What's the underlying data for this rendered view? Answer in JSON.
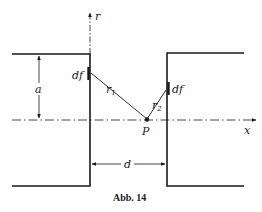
{
  "figure": {
    "caption": "Abb. 14",
    "axes": {
      "r_label": "r",
      "x_label": "x"
    },
    "labels": {
      "a": "a",
      "d": "d",
      "df_left": "df",
      "df_right": "df",
      "r1_main": "r",
      "r1_sub": "1",
      "r2_main": "r",
      "r2_sub": "2",
      "point": "P"
    },
    "colors": {
      "ink": "#1a1a1a",
      "background": "#ffffff"
    }
  }
}
